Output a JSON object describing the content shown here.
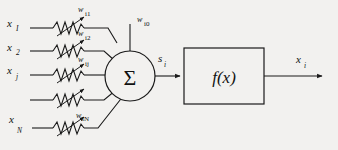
{
  "diagram": {
    "background_color": "#f2f1ef",
    "line_color": "#1a1a1a",
    "inputs": [
      {
        "label": "x",
        "sub": "I",
        "weight": "w",
        "weight_sub": "i1"
      },
      {
        "label": "x",
        "sub": "2",
        "weight": "w",
        "weight_sub": "i2"
      },
      {
        "label": "x",
        "sub": "j",
        "weight": "w",
        "weight_sub": "ij"
      },
      {
        "label": "",
        "sub": "",
        "weight": "",
        "weight_sub": ""
      },
      {
        "label": "x",
        "sub": "N",
        "weight": "w",
        "weight_sub": "iN"
      }
    ],
    "bias": {
      "label": "w",
      "sub": "i0"
    },
    "summation": {
      "symbol": "Σ",
      "output_label": "s",
      "output_sub": "i"
    },
    "activation": {
      "label": "f(x)"
    },
    "output": {
      "label": "x",
      "sub": "i"
    }
  }
}
